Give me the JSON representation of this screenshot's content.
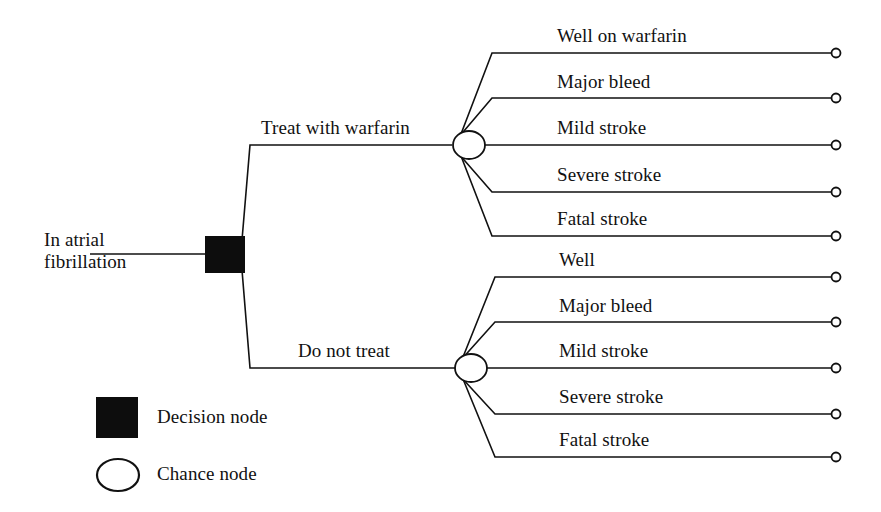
{
  "diagram": {
    "type": "decision-tree",
    "title_text": "",
    "root": {
      "label": "In atrial fibrillation",
      "label_line1": "In atrial",
      "label_line2": "fibrillation",
      "node_type": "decision-node"
    },
    "decision_branches": [
      {
        "label": "Treat with warfarin",
        "node_type": "chance-node",
        "outcomes": [
          {
            "label": "Well on warfarin",
            "terminal": "terminal-node"
          },
          {
            "label": "Major bleed",
            "terminal": "terminal-node"
          },
          {
            "label": "Mild stroke",
            "terminal": "terminal-node"
          },
          {
            "label": "Severe stroke",
            "terminal": "terminal-node"
          },
          {
            "label": "Fatal stroke",
            "terminal": "terminal-node"
          }
        ]
      },
      {
        "label": "Do not treat",
        "node_type": "chance-node",
        "outcomes": [
          {
            "label": "Well",
            "terminal": "terminal-node"
          },
          {
            "label": "Major bleed",
            "terminal": "terminal-node"
          },
          {
            "label": "Mild stroke",
            "terminal": "terminal-node"
          },
          {
            "label": "Severe stroke",
            "terminal": "terminal-node"
          },
          {
            "label": "Fatal stroke",
            "terminal": "terminal-node"
          }
        ]
      }
    ],
    "legend": [
      {
        "symbol": "filled-square",
        "label": "Decision node"
      },
      {
        "symbol": "open-ellipse",
        "label": "Chance node"
      }
    ],
    "colors": {
      "line": "#111111",
      "decision_node_fill": "#0d0d0d",
      "chance_node_fill": "#ffffff",
      "background": "#ffffff",
      "text": "#111111"
    }
  }
}
